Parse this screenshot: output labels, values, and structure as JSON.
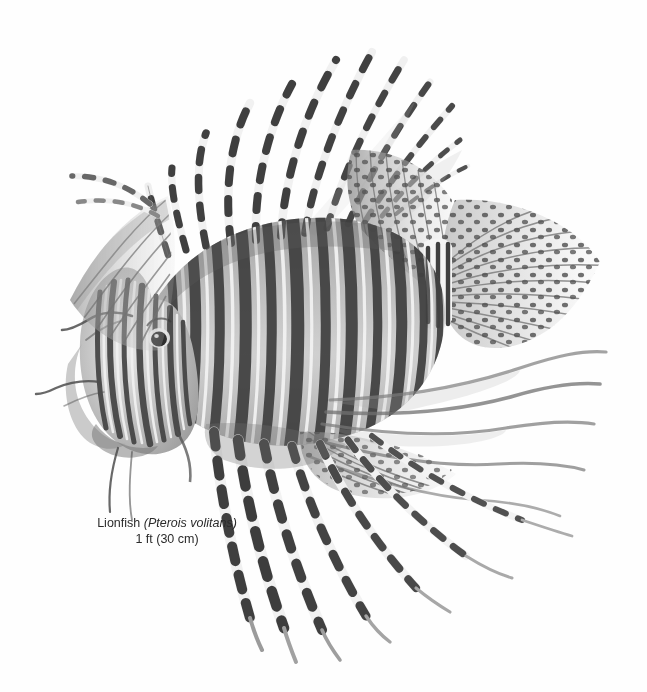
{
  "plate": {
    "background_color": "#fefefe",
    "ink_color": "#3a3a3a",
    "medium": "grayscale watercolor / ink field-guide illustration",
    "subject": "lionfish"
  },
  "caption": {
    "common_name": "Lionfish",
    "scientific_name": "(Pterois volitans)",
    "size_label": "1 ft (30 cm)",
    "text_color": "#2b2b2b"
  },
  "figure": {
    "title": "Lionfish illustration",
    "orientation": "head facing left, tail to right",
    "parts": [
      {
        "name": "head",
        "detail": "striped head with barbels and dark eye"
      },
      {
        "name": "eye",
        "detail": "dark round eye with pale ring"
      },
      {
        "name": "body",
        "detail": "vertical dark and pale banded flank"
      },
      {
        "name": "dorsal-spines",
        "detail": "long venomous spines with black and white bands"
      },
      {
        "name": "soft-dorsal-fin",
        "detail": "translucent rayed fin with dark spots"
      },
      {
        "name": "caudal-fin",
        "detail": "fan-shaped tail with spotted rays"
      },
      {
        "name": "pectoral-fins",
        "detail": "long banded ray filaments"
      },
      {
        "name": "pelvic-fins",
        "detail": "trailing banded streamers"
      },
      {
        "name": "anal-fin",
        "detail": "spotted rayed fin beneath tail"
      }
    ]
  }
}
